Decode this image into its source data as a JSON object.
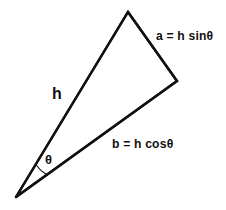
{
  "figure": {
    "background_color": "#ffffff",
    "stroke_color": "#111111",
    "text_color": "#111111",
    "labels": {
      "hypotenuse": "h",
      "opposite": "a = h sinθ",
      "adjacent": "b = h cosθ",
      "angle": "θ"
    }
  },
  "chart_data": {
    "type": "diagram",
    "subtype": "right-triangle-trigonometry",
    "title": "",
    "xlabel": "",
    "ylabel": "",
    "grid": false,
    "legend": null,
    "axis_visible": false,
    "coordinate_space": {
      "width": 226,
      "height": 210,
      "origin": "top-left",
      "units": "pixels"
    },
    "vertices": [
      {
        "name": "apex",
        "label": "θ",
        "x": 16,
        "y": 197
      },
      {
        "name": "top",
        "label": "",
        "x": 128,
        "y": 12
      },
      {
        "name": "right-angle-corner",
        "label": "",
        "x": 177,
        "y": 81
      }
    ],
    "edges": [
      {
        "name": "hypotenuse",
        "label": "h",
        "from": "apex",
        "to": "top",
        "x1": 16,
        "y1": 197,
        "x2": 128,
        "y2": 12,
        "label_x": 59,
        "label_y": 95
      },
      {
        "name": "opposite",
        "label": "a = h sinθ",
        "from": "top",
        "to": "right-angle-corner",
        "x1": 128,
        "y1": 12,
        "x2": 177,
        "y2": 81,
        "label_x": 157,
        "label_y": 36
      },
      {
        "name": "adjacent",
        "label": "b = h cosθ",
        "from": "apex",
        "to": "right-angle-corner",
        "x1": 16,
        "y1": 197,
        "x2": 177,
        "y2": 81,
        "label_x": 113,
        "label_y": 144
      }
    ],
    "angle_marker": {
      "name": "theta-arc",
      "label": "θ",
      "at_vertex": "apex",
      "arc_radius": 38,
      "label_x": 50,
      "label_y": 160
    },
    "annotations": [
      "a = h sinθ",
      "b = h cosθ",
      "h",
      "θ"
    ]
  }
}
